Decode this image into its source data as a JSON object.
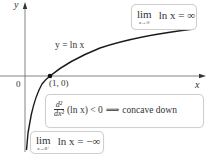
{
  "diagram": {
    "curve_label": "y = ln x",
    "axes": {
      "x_label": "x",
      "y_label": "y",
      "origin_label": "0"
    },
    "point": {
      "label": "(1, 0)"
    },
    "annotations": {
      "limit_infinity": {
        "word": "lim",
        "subscript": "x→∞",
        "expression": "ln x = ∞"
      },
      "concavity": {
        "numerator": "d²",
        "denominator": "dx²",
        "expression": "(ln x) < 0",
        "implies": "⟹",
        "conclusion": "concave down"
      },
      "limit_zero": {
        "word": "lim",
        "subscript": "x→0⁺",
        "expression": "ln x = −∞"
      }
    },
    "colors": {
      "axis": "#555555",
      "curve": "#1a1a1a",
      "box_border": "#cfcfcf",
      "text": "#333333"
    }
  }
}
